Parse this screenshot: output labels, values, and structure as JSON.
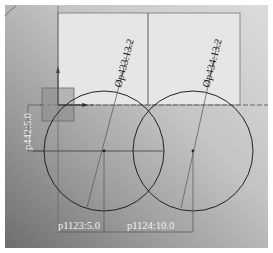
{
  "canvas": {
    "background_top": "#d4d4d4",
    "background_bottom": "#7a7a7a",
    "sheet_color": "#e4e4e4",
    "line_color": "#2a2a2a"
  },
  "dimensions": {
    "diameter_left": "Øp433:13.2",
    "diameter_right": "Øp434:13.2",
    "vertical_offset": "p442:5.0",
    "horizontal_left": "p1123:5.0",
    "horizontal_right": "p1124:10.0"
  },
  "sketch": {
    "circles": [
      {
        "name": "left-circle",
        "cx": 104,
        "cy": 151,
        "r": 60
      },
      {
        "name": "right-circle",
        "cx": 193,
        "cy": 151,
        "r": 60
      }
    ],
    "origin": {
      "x": 58,
      "y": 105
    },
    "selection_box": {
      "x": 42,
      "y": 88,
      "w": 32,
      "h": 33
    }
  }
}
